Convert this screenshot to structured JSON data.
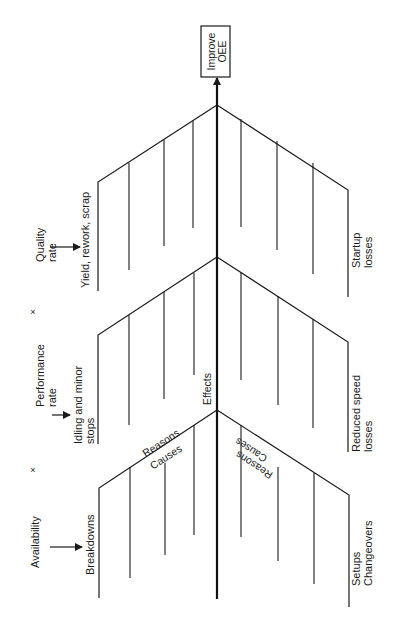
{
  "diagram": {
    "type": "fishbone",
    "orientation": "rotated-90-ccw",
    "goal": {
      "lines": [
        "Improve",
        "OEE"
      ],
      "box": {
        "x": 201,
        "y": 26,
        "w": 29,
        "h": 51
      }
    },
    "spine": {
      "x": 217,
      "y_top": 84,
      "y_bottom": 599
    },
    "colors": {
      "ink": "#1a1a1a",
      "background": "#ffffff"
    },
    "junctions": [
      {
        "y": 105,
        "left": {
          "tip": [
            98,
            182
          ],
          "tip_bottom": 291,
          "ribs": [
            [
              129,
              163,
              270
            ],
            [
              164,
              140,
              246
            ],
            [
              193,
              121,
              228
            ]
          ],
          "label": [
            "Yield, rework, scrap"
          ],
          "label_pos": [
            89,
            288
          ]
        },
        "right": {
          "tip": [
            348,
            190
          ],
          "tip_bottom": 297,
          "ribs": [
            [
              241,
              119,
              227
            ],
            [
              277,
              141,
              250
            ],
            [
              313,
              163,
              274
            ]
          ],
          "label": [
            "Startup",
            "losses"
          ],
          "label_pos": [
            360,
            268
          ]
        }
      },
      {
        "y": 257,
        "left": {
          "tip": [
            98,
            335
          ],
          "tip_bottom": 444,
          "ribs": [
            [
              129,
              315,
              425
            ],
            [
              164,
              292,
              399
            ],
            [
              194,
              273,
              375
            ]
          ],
          "label": [
            "Idling and minor",
            "stops"
          ],
          "label_pos": [
            82,
            444
          ]
        },
        "right": {
          "tip": [
            348,
            342
          ],
          "tip_bottom": 452,
          "ribs": [
            [
              241,
              272,
              380
            ],
            [
              278,
              296,
              405
            ],
            [
              313,
              319,
              428
            ]
          ],
          "label": [
            "Reduced speed",
            "losses"
          ],
          "label_pos": [
            360,
            452
          ]
        }
      },
      {
        "y": 410,
        "left": {
          "tip": [
            99,
            488
          ],
          "tip_bottom": 598,
          "ribs": [
            [
              130,
              467,
              578
            ],
            [
              165,
              463,
              555
            ],
            [
              194,
              425,
              535
            ]
          ],
          "label": [
            "Breakdowns"
          ],
          "label_pos": [
            94,
            575
          ]
        },
        "right": {
          "tip": [
            349,
            495
          ],
          "tip_bottom": 607,
          "ribs": [
            [
              241,
              425,
              537
            ],
            [
              278,
              467,
              561
            ],
            [
              314,
              473,
              584
            ]
          ],
          "label": [
            "Setups",
            "Changeovers"
          ],
          "label_pos": [
            360,
            586
          ]
        }
      }
    ],
    "factors": [
      {
        "lines": [
          "Quality",
          "rate"
        ],
        "pos": [
          44,
          262
        ],
        "arrow": {
          "x1": 50,
          "x2": 80,
          "y": 247
        }
      },
      {
        "lines": [
          "Performance",
          "rate"
        ],
        "pos": [
          44,
          407
        ],
        "arrow": {
          "x1": 52,
          "x2": 70,
          "y": 415
        }
      },
      {
        "lines": [
          "Availability"
        ],
        "pos": [
          39,
          568
        ],
        "arrow": {
          "x1": 50,
          "x2": 82,
          "y": 547
        }
      }
    ],
    "multipliers": [
      {
        "symbol": "×",
        "pos": [
          33,
          315
        ]
      },
      {
        "symbol": "×",
        "pos": [
          33,
          473
        ]
      }
    ],
    "annotations": [
      {
        "text": "Effects",
        "x": 211,
        "y": 405,
        "rotate": -90,
        "anchor": "start"
      },
      {
        "text": "Reasons",
        "x": 163,
        "y": 446,
        "rotate": -33,
        "anchor": "middle"
      },
      {
        "text": "Causes",
        "x": 168,
        "y": 460,
        "rotate": -33,
        "anchor": "middle"
      },
      {
        "text": "Causes",
        "x": 253,
        "y": 447,
        "rotate": 213,
        "anchor": "middle"
      },
      {
        "text": "Reasons",
        "x": 256,
        "y": 462,
        "rotate": 213,
        "anchor": "middle"
      }
    ]
  }
}
